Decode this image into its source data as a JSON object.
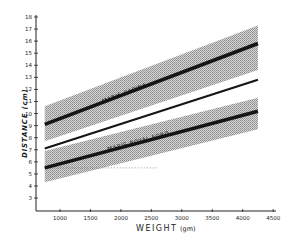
{
  "chart_data": {
    "type": "line",
    "title": "",
    "xlabel": "WEIGHT (gm)",
    "ylabel": "DISTANCE (cm)",
    "xlim": [
      500,
      4500
    ],
    "ylim": [
      2,
      18
    ],
    "x_ticks": [
      1000,
      1500,
      2000,
      2500,
      3000,
      3500,
      4000,
      4500
    ],
    "y_ticks": [
      3,
      4,
      5,
      6,
      7,
      8,
      9,
      10,
      11,
      12,
      13,
      14,
      15,
      16,
      17,
      18
    ],
    "grid": false,
    "legend": "inline labels",
    "series": [
      {
        "name": "MARIS-CAPINA",
        "x": [
          750,
          4250
        ],
        "values": [
          9.1,
          15.8
        ],
        "band_upper": [
          10.6,
          17.3
        ],
        "band_lower": [
          7.7,
          13.6
        ],
        "style": "thick"
      },
      {
        "name": "middle reference line",
        "x": [
          750,
          4250
        ],
        "values": [
          7.1,
          12.8
        ],
        "style": "thin"
      },
      {
        "name": "MARIS-ROYAL FORD",
        "x": [
          750,
          4250
        ],
        "values": [
          5.5,
          10.2
        ],
        "band_upper": [
          6.9,
          11.3
        ],
        "band_lower": [
          4.3,
          8.7
        ],
        "style": "thick"
      }
    ],
    "annotations": [
      {
        "text": "MARIS-CAPINA",
        "position": "on upper band"
      },
      {
        "text": "MARIS-ROYAL FORD",
        "position": "on lower band"
      },
      {
        "text": "dotted horizontal line at y=5.5",
        "position": "lower band"
      }
    ]
  },
  "labels": {
    "xlabel": "WEIGHT",
    "xunit": "(gm)",
    "ylabel": "DISTANCE (cm)",
    "capina": "MARIS-CAPINA",
    "royalford": "MARIS-ROYAL FORD"
  }
}
